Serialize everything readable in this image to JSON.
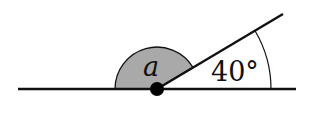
{
  "diagram": {
    "type": "angle-on-straight-line",
    "labels": {
      "unknown_angle": "a",
      "known_angle": "40°"
    },
    "colors": {
      "line": "#111111",
      "sector_fill": "#a9a9a9",
      "background": "#ffffff"
    }
  }
}
